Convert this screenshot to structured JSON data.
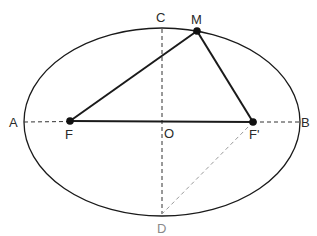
{
  "diagram": {
    "type": "ellipse-foci",
    "colors": {
      "stroke": "#1a1a1a",
      "dashed": "#333333",
      "dashed_light": "#9a9a9a",
      "background": "#ffffff"
    },
    "ellipse": {
      "cx": 162,
      "cy": 122,
      "rx": 138,
      "ry": 94
    },
    "points": {
      "A": {
        "label": "A",
        "x": 24,
        "y": 122
      },
      "B": {
        "label": "B",
        "x": 300,
        "y": 122
      },
      "C": {
        "label": "C",
        "x": 162,
        "y": 28
      },
      "D": {
        "label": "D",
        "x": 162,
        "y": 214
      },
      "O": {
        "label": "O",
        "x": 162,
        "y": 122
      },
      "F": {
        "label": "F",
        "x": 70,
        "y": 121
      },
      "F_prime": {
        "label": "F'",
        "x": 253,
        "y": 122
      },
      "M": {
        "label": "M",
        "x": 197,
        "y": 31
      }
    },
    "segments": [
      {
        "from": "F",
        "to": "M",
        "style": "solid"
      },
      {
        "from": "M",
        "to": "F_prime",
        "style": "solid"
      },
      {
        "from": "F",
        "to": "F_prime",
        "style": "solid"
      },
      {
        "from": "A",
        "to": "F",
        "style": "dashed"
      },
      {
        "from": "F_prime",
        "to": "B",
        "style": "dashed"
      },
      {
        "from": "C",
        "to": "D",
        "style": "dashed"
      },
      {
        "from": "F_prime",
        "to": "D",
        "style": "dashed-light"
      }
    ]
  }
}
